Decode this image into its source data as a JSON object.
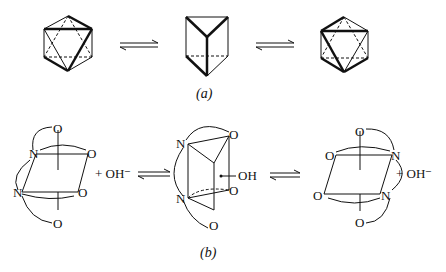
{
  "figure": {
    "panel_a": {
      "label": "(a)",
      "structures": [
        "octahedron-left",
        "trigonal-prism",
        "octahedron-right"
      ],
      "equilibria": 2
    },
    "panel_b": {
      "label": "(b)",
      "left": {
        "atoms": [
          "O",
          "N",
          "O",
          "N",
          "O",
          "O"
        ],
        "reagent": "+ OH⁻"
      },
      "middle": {
        "atoms": [
          "N",
          "O",
          "N",
          "O",
          "O"
        ],
        "substituent": "OH"
      },
      "right": {
        "atoms": [
          "O",
          "O",
          "N",
          "O",
          "N",
          "O"
        ],
        "product": "+ OH⁻"
      }
    }
  }
}
